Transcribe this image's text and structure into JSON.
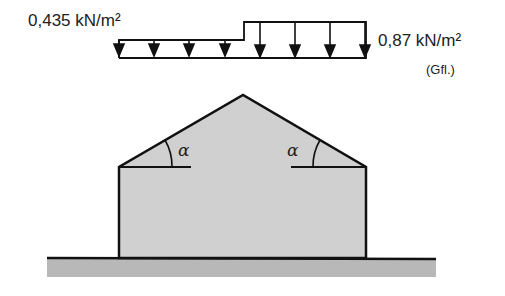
{
  "diagram": {
    "type": "roof load diagram",
    "loads": {
      "left": {
        "label": "0,435 kN/m²",
        "value": 0.435,
        "unit": "kN/m²",
        "arrow_count": 4
      },
      "right": {
        "label": "0,87 kN/m²",
        "value": 0.87,
        "unit": "kN/m²",
        "note": "(Gfl.)",
        "arrow_count": 4
      }
    },
    "roof": {
      "shape": "gable",
      "angle_labels": [
        "α",
        "α"
      ]
    },
    "colors": {
      "fill": "#cfcfcf",
      "stroke": "#111111",
      "ground": "#b5b5b5"
    }
  }
}
